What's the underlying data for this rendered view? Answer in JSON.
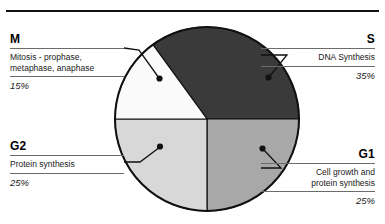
{
  "figure": {
    "background_color": "#ffffff",
    "rule_color": "#111111"
  },
  "chart_data": {
    "type": "pie",
    "title": "",
    "subtitle": "",
    "xlabel": "",
    "ylabel": "",
    "legend_position": "callout-labels",
    "grid": false,
    "total": 100,
    "units": "%",
    "start_angle_deg": -90,
    "direction": "clockwise",
    "categories": [
      "S",
      "G1",
      "G2",
      "M"
    ],
    "values": [
      35,
      25,
      25,
      15
    ],
    "slices": [
      {
        "key": "S",
        "label": "S",
        "description": "DNA Synthesis",
        "percent": "35%",
        "value": 35,
        "color": "#3a3a3a",
        "side": "right"
      },
      {
        "key": "G1",
        "label": "G1",
        "description": "Cell growth and protein synthesis",
        "percent": "25%",
        "value": 25,
        "color": "#a8a8a8",
        "side": "right"
      },
      {
        "key": "G2",
        "label": "G2",
        "description": "Protein synthesis",
        "percent": "25%",
        "value": 25,
        "color": "#d8d8d8",
        "side": "left"
      },
      {
        "key": "M",
        "label": "M",
        "description": "Mitosis - prophase, metaphase, anaphase",
        "percent": "15%",
        "value": 15,
        "color": "#fafafa",
        "side": "left"
      }
    ]
  },
  "labels": {
    "m": {
      "key": "M",
      "line1": "Mitosis - prophase,",
      "line2": "metaphase, anaphase",
      "percent": "15%"
    },
    "s": {
      "key": "S",
      "line1": "DNA Synthesis",
      "line2": "",
      "percent": "35%"
    },
    "g2": {
      "key": "G2",
      "line1": "Protein synthesis",
      "line2": "",
      "percent": "25%"
    },
    "g1": {
      "key": "G1",
      "line1": "Cell growth and",
      "line2": "protein synthesis",
      "percent": "25%"
    }
  }
}
